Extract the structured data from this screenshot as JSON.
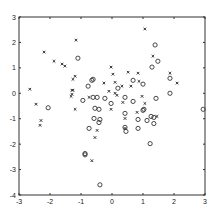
{
  "chart_data": {
    "type": "scatter",
    "title": "",
    "xlabel": "",
    "ylabel": "",
    "xlim": [
      -3,
      3
    ],
    "ylim": [
      -4,
      3
    ],
    "grid": false,
    "legend": null,
    "x_ticks": [
      -3,
      -2,
      -1,
      0,
      1,
      2,
      3
    ],
    "y_ticks": [
      -4,
      -3,
      -2,
      -1,
      0,
      1,
      2,
      3
    ],
    "x_tick_labels": [
      "-3",
      "-2",
      "-1",
      "0",
      "1",
      "2",
      "3"
    ],
    "y_tick_labels": [
      "-4",
      "-3",
      "-2",
      "-1",
      "0",
      "1",
      "2",
      "3"
    ],
    "series": [
      {
        "name": "x",
        "marker": "x",
        "points": [
          [
            -1.16,
            2.09
          ],
          [
            -2.19,
            1.62
          ],
          [
            -1.87,
            1.26
          ],
          [
            -1.61,
            1.15
          ],
          [
            -1.52,
            1.07
          ],
          [
            -1.19,
            0.67
          ],
          [
            -1.26,
            0.55
          ],
          [
            -2.65,
            0.16
          ],
          [
            -2.45,
            -0.43
          ],
          [
            -1.29,
            0.12
          ],
          [
            -1.32,
            -0.12
          ],
          [
            1.06,
            2.53
          ],
          [
            1.32,
            1.46
          ],
          [
            1.87,
            0.79
          ],
          [
            2.1,
            0.4
          ],
          [
            0.84,
            0.79
          ],
          [
            0.52,
            0.83
          ],
          [
            0.87,
            0.47
          ],
          [
            0.61,
            0.28
          ],
          [
            0.32,
            0.28
          ],
          [
            0.1,
            0.43
          ],
          [
            0.03,
            0.75
          ],
          [
            -0.03,
            1.03
          ],
          [
            0.16,
            -0.08
          ],
          [
            0.35,
            -0.36
          ],
          [
            0.97,
            -0.12
          ],
          [
            1.06,
            -0.4
          ],
          [
            -2.29,
            -1.07
          ],
          [
            -2.32,
            -1.26
          ],
          [
            -0.48,
            -1.46
          ],
          [
            -0.55,
            -1.74
          ],
          [
            -0.65,
            -2.65
          ],
          [
            -1.19,
            -0.63
          ],
          [
            0.42,
            -0.99
          ],
          [
            0.81,
            -0.75
          ],
          [
            1.45,
            -0.91
          ],
          [
            0.42,
            -1.38
          ],
          [
            -0.26,
            0.4
          ],
          [
            -1.26,
            0.12
          ],
          [
            -0.1,
            0.08
          ],
          [
            -0.74,
            -0.16
          ],
          [
            -1.29,
            -0.04
          ],
          [
            -0.03,
            -0.63
          ],
          [
            0.1,
            0.0
          ]
        ]
      },
      {
        "name": "o",
        "marker": "o",
        "points": [
          [
            -1.1,
            1.38
          ],
          [
            -0.65,
            0.51
          ],
          [
            -0.77,
            0.28
          ],
          [
            -2.06,
            -0.57
          ],
          [
            1.39,
            1.9
          ],
          [
            1.48,
            1.26
          ],
          [
            1.29,
            1.03
          ],
          [
            1.87,
            0.59
          ],
          [
            1.87,
            0.0
          ],
          [
            1.42,
            -0.2
          ],
          [
            0.68,
            0.51
          ],
          [
            1.0,
            0.36
          ],
          [
            0.19,
            0.2
          ],
          [
            0.42,
            -0.16
          ],
          [
            0.68,
            -0.32
          ],
          [
            1.03,
            -0.63
          ],
          [
            2.94,
            -0.63
          ],
          [
            -0.58,
            -0.99
          ],
          [
            -0.39,
            -1.03
          ],
          [
            -0.42,
            -1.15
          ],
          [
            -0.74,
            -1.38
          ],
          [
            -0.87,
            -2.37
          ],
          [
            -0.87,
            -2.42
          ],
          [
            -0.39,
            -3.6
          ],
          [
            0.42,
            -0.79
          ],
          [
            1.0,
            -0.67
          ],
          [
            0.84,
            -1.03
          ],
          [
            1.13,
            -1.07
          ],
          [
            1.26,
            -0.91
          ],
          [
            1.35,
            -0.95
          ],
          [
            1.35,
            -1.19
          ],
          [
            0.42,
            -1.34
          ],
          [
            0.45,
            -1.5
          ],
          [
            0.84,
            -1.38
          ],
          [
            1.23,
            -1.98
          ],
          [
            -0.23,
            -0.2
          ],
          [
            -0.94,
            -0.28
          ],
          [
            -0.61,
            -0.16
          ],
          [
            -0.48,
            -0.16
          ],
          [
            -0.55,
            -0.59
          ],
          [
            -0.42,
            -0.63
          ],
          [
            -0.03,
            -0.4
          ],
          [
            -0.61,
            0.55
          ]
        ]
      }
    ]
  },
  "plot_area": {
    "left": 19,
    "top": 17,
    "right": 205,
    "bottom": 195
  },
  "colors": {
    "axis": "#333333",
    "marker": "#333333",
    "background": "#ffffff"
  }
}
